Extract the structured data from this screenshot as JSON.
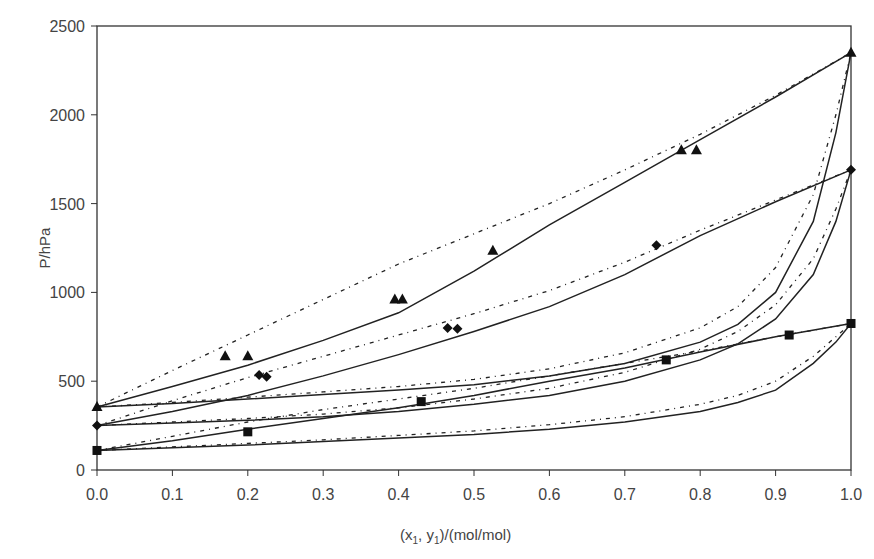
{
  "chart_data": {
    "type": "line",
    "title": "",
    "xlabel": "(x1, y1)/(mol/mol)",
    "xlabel_parts": {
      "pre": "(x",
      "sub1": "1",
      "mid": ", y",
      "sub2": "1",
      "post": ")/(mol/mol)"
    },
    "ylabel": "P/hPa",
    "xlim": [
      0.0,
      1.0
    ],
    "ylim": [
      0,
      2500
    ],
    "xticks": [
      "0.0",
      "0.1",
      "0.2",
      "0.3",
      "0.4",
      "0.5",
      "0.6",
      "0.7",
      "0.8",
      "0.9",
      "1.0"
    ],
    "yticks": [
      "0",
      "500",
      "1000",
      "1500",
      "2000",
      "2500"
    ],
    "grid": false,
    "legend": "none",
    "series": [
      {
        "name": "system-1 (triangles)",
        "marker": "triangle",
        "points": [
          [
            0.0,
            355
          ],
          [
            0.17,
            640
          ],
          [
            0.2,
            640
          ],
          [
            0.395,
            960
          ],
          [
            0.405,
            960
          ],
          [
            0.525,
            1235
          ],
          [
            0.775,
            1800
          ],
          [
            0.795,
            1800
          ],
          [
            1.0,
            2350
          ]
        ],
        "bubble_solid": [
          [
            0,
            355
          ],
          [
            0.1,
            470
          ],
          [
            0.2,
            590
          ],
          [
            0.3,
            730
          ],
          [
            0.4,
            885
          ],
          [
            0.5,
            1120
          ],
          [
            0.6,
            1380
          ],
          [
            0.7,
            1620
          ],
          [
            0.8,
            1860
          ],
          [
            0.9,
            2100
          ],
          [
            1,
            2350
          ]
        ],
        "bubble_dotted": [
          [
            0,
            355
          ],
          [
            0.1,
            560
          ],
          [
            0.2,
            760
          ],
          [
            0.3,
            960
          ],
          [
            0.4,
            1160
          ],
          [
            0.5,
            1330
          ],
          [
            0.6,
            1500
          ],
          [
            0.7,
            1690
          ],
          [
            0.8,
            1890
          ],
          [
            0.9,
            2110
          ],
          [
            1,
            2350
          ]
        ],
        "dew_solid": [
          [
            0,
            355
          ],
          [
            0.1,
            375
          ],
          [
            0.2,
            400
          ],
          [
            0.3,
            425
          ],
          [
            0.4,
            450
          ],
          [
            0.5,
            480
          ],
          [
            0.6,
            530
          ],
          [
            0.7,
            600
          ],
          [
            0.8,
            720
          ],
          [
            0.85,
            820
          ],
          [
            0.9,
            1000
          ],
          [
            0.95,
            1400
          ],
          [
            0.98,
            1900
          ],
          [
            1,
            2350
          ]
        ],
        "dew_dotted": [
          [
            0,
            355
          ],
          [
            0.1,
            380
          ],
          [
            0.2,
            410
          ],
          [
            0.3,
            440
          ],
          [
            0.4,
            470
          ],
          [
            0.5,
            510
          ],
          [
            0.6,
            570
          ],
          [
            0.7,
            660
          ],
          [
            0.8,
            800
          ],
          [
            0.85,
            920
          ],
          [
            0.9,
            1140
          ],
          [
            0.95,
            1550
          ],
          [
            0.98,
            2000
          ],
          [
            1,
            2350
          ]
        ]
      },
      {
        "name": "system-2 (diamonds)",
        "marker": "diamond",
        "points": [
          [
            0.0,
            250
          ],
          [
            0.215,
            535
          ],
          [
            0.225,
            525
          ],
          [
            0.465,
            800
          ],
          [
            0.478,
            795
          ],
          [
            0.742,
            1265
          ],
          [
            1.0,
            1690
          ]
        ],
        "bubble_solid": [
          [
            0,
            250
          ],
          [
            0.1,
            330
          ],
          [
            0.2,
            420
          ],
          [
            0.3,
            530
          ],
          [
            0.4,
            650
          ],
          [
            0.5,
            780
          ],
          [
            0.6,
            920
          ],
          [
            0.7,
            1100
          ],
          [
            0.8,
            1320
          ],
          [
            0.9,
            1510
          ],
          [
            1,
            1690
          ]
        ],
        "bubble_dotted": [
          [
            0,
            250
          ],
          [
            0.1,
            390
          ],
          [
            0.2,
            520
          ],
          [
            0.3,
            640
          ],
          [
            0.4,
            760
          ],
          [
            0.5,
            880
          ],
          [
            0.6,
            1010
          ],
          [
            0.7,
            1170
          ],
          [
            0.8,
            1350
          ],
          [
            0.9,
            1520
          ],
          [
            1,
            1690
          ]
        ],
        "dew_solid": [
          [
            0,
            250
          ],
          [
            0.1,
            265
          ],
          [
            0.2,
            280
          ],
          [
            0.3,
            300
          ],
          [
            0.4,
            330
          ],
          [
            0.5,
            370
          ],
          [
            0.6,
            420
          ],
          [
            0.7,
            500
          ],
          [
            0.8,
            620
          ],
          [
            0.85,
            710
          ],
          [
            0.9,
            850
          ],
          [
            0.95,
            1100
          ],
          [
            0.98,
            1400
          ],
          [
            1,
            1690
          ]
        ],
        "dew_dotted": [
          [
            0,
            250
          ],
          [
            0.1,
            270
          ],
          [
            0.2,
            290
          ],
          [
            0.3,
            315
          ],
          [
            0.4,
            350
          ],
          [
            0.5,
            400
          ],
          [
            0.6,
            460
          ],
          [
            0.7,
            550
          ],
          [
            0.8,
            680
          ],
          [
            0.85,
            780
          ],
          [
            0.9,
            930
          ],
          [
            0.95,
            1190
          ],
          [
            0.98,
            1470
          ],
          [
            1,
            1690
          ]
        ]
      },
      {
        "name": "system-3 (squares)",
        "marker": "square",
        "points": [
          [
            0.0,
            110
          ],
          [
            0.2,
            215
          ],
          [
            0.43,
            385
          ],
          [
            0.755,
            620
          ],
          [
            0.918,
            760
          ],
          [
            1.0,
            825
          ]
        ],
        "bubble_solid": [
          [
            0,
            110
          ],
          [
            0.1,
            165
          ],
          [
            0.2,
            230
          ],
          [
            0.3,
            290
          ],
          [
            0.4,
            350
          ],
          [
            0.5,
            420
          ],
          [
            0.6,
            500
          ],
          [
            0.7,
            575
          ],
          [
            0.75,
            620
          ],
          [
            0.8,
            665
          ],
          [
            0.9,
            750
          ],
          [
            1,
            825
          ]
        ],
        "bubble_dotted": [
          [
            0,
            110
          ],
          [
            0.1,
            190
          ],
          [
            0.2,
            270
          ],
          [
            0.3,
            340
          ],
          [
            0.4,
            400
          ],
          [
            0.5,
            460
          ],
          [
            0.6,
            530
          ],
          [
            0.7,
            600
          ],
          [
            0.8,
            670
          ],
          [
            0.9,
            750
          ],
          [
            1,
            825
          ]
        ],
        "dew_solid": [
          [
            0,
            110
          ],
          [
            0.1,
            125
          ],
          [
            0.2,
            140
          ],
          [
            0.3,
            160
          ],
          [
            0.4,
            180
          ],
          [
            0.5,
            200
          ],
          [
            0.6,
            230
          ],
          [
            0.7,
            270
          ],
          [
            0.8,
            330
          ],
          [
            0.85,
            380
          ],
          [
            0.9,
            450
          ],
          [
            0.95,
            600
          ],
          [
            0.98,
            720
          ],
          [
            1,
            825
          ]
        ],
        "dew_dotted": [
          [
            0,
            110
          ],
          [
            0.1,
            130
          ],
          [
            0.2,
            150
          ],
          [
            0.3,
            170
          ],
          [
            0.4,
            195
          ],
          [
            0.5,
            220
          ],
          [
            0.6,
            255
          ],
          [
            0.7,
            300
          ],
          [
            0.8,
            370
          ],
          [
            0.85,
            420
          ],
          [
            0.9,
            500
          ],
          [
            0.95,
            640
          ],
          [
            0.98,
            750
          ],
          [
            1,
            825
          ]
        ]
      }
    ]
  },
  "style": {
    "line_color": "#222222",
    "axis_color": "#333333",
    "marker_color": "#111111"
  }
}
